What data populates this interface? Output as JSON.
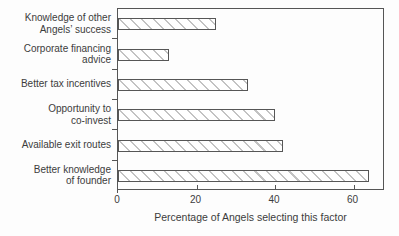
{
  "chart_data": {
    "type": "bar",
    "orientation": "horizontal",
    "title": "",
    "xlabel": "Percentage of Angels selecting this factor",
    "ylabel": "",
    "xlim": [
      0,
      68
    ],
    "xticks": [
      0,
      20,
      40,
      60
    ],
    "grid": false,
    "legend": false,
    "categories": [
      "Knowledge of other Angels’ success",
      "Corporate financing advice",
      "Better tax incentives",
      "Opportunity to co-invest",
      "Available exit routes",
      "Better knowledge of founder"
    ],
    "category_label_lines": [
      [
        "Knowledge of other",
        "Angels’ success"
      ],
      [
        "Corporate financing",
        "advice"
      ],
      [
        "Better tax incentives"
      ],
      [
        "Opportunity to",
        "co-invest"
      ],
      [
        "Available exit routes"
      ],
      [
        "Better knowledge",
        "of founder"
      ]
    ],
    "values": [
      25,
      13,
      33,
      40,
      42,
      64
    ],
    "style": {
      "bar_fill": "#ffffff",
      "hatch_color": "#c3c3c3",
      "hatch_pattern": "diagonal-backslash",
      "bar_border": "#565656",
      "axis_color": "#555555",
      "text_color": "#3c3c3c",
      "background": "#fdfdfd"
    }
  }
}
